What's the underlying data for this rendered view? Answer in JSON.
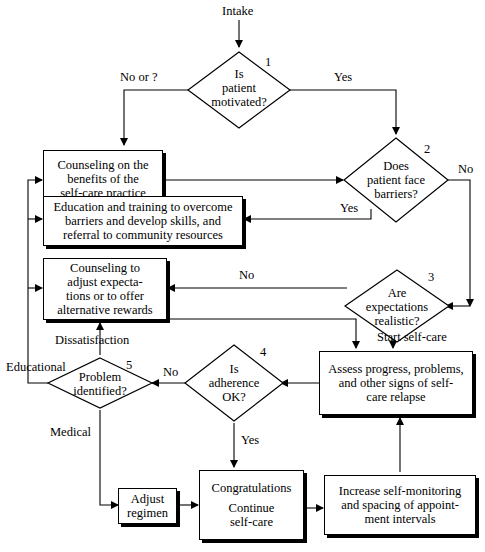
{
  "diagram": {
    "type": "flowchart",
    "start": "Intake",
    "decisions": [
      {
        "id": "d1",
        "number": "1",
        "text": "Is patient motivated?",
        "lines": [
          "Is",
          "patient",
          "motivated?"
        ]
      },
      {
        "id": "d2",
        "number": "2",
        "text": "Does patient face barriers?",
        "lines": [
          "Does",
          "patient face",
          "barriers?"
        ]
      },
      {
        "id": "d3",
        "number": "3",
        "text": "Are expectations realistic?",
        "lines": [
          "Are",
          "expectations",
          "realistic?"
        ]
      },
      {
        "id": "d4",
        "number": "4",
        "text": "Is adherence OK?",
        "lines": [
          "Is",
          "adherence",
          "OK?"
        ]
      },
      {
        "id": "d5",
        "number": "5",
        "text": "Problem identified?",
        "lines": [
          "Problem",
          "identified?"
        ]
      }
    ],
    "processes": [
      {
        "id": "p_counsel_benefits",
        "lines": [
          "Counseling on the",
          "benefits of the",
          "self-care practice"
        ]
      },
      {
        "id": "p_education",
        "lines": [
          "Education and training to overcome",
          "barriers and develop skills, and",
          "referral to community resources"
        ]
      },
      {
        "id": "p_counsel_adjust",
        "lines": [
          "Counseling to",
          "adjust expecta-",
          "tions or to offer",
          "alternative rewards"
        ]
      },
      {
        "id": "p_assess",
        "lines": [
          "Assess progress, problems,",
          "and other signs of self-",
          "care relapse"
        ]
      },
      {
        "id": "p_adjust_regimen",
        "lines": [
          "Adjust",
          "regimen"
        ]
      },
      {
        "id": "p_congrats",
        "lines": [
          "Congratulations",
          "",
          "Continue",
          "self-care"
        ]
      },
      {
        "id": "p_increase",
        "lines": [
          "Increase self-monitoring",
          "and spacing of appoint-",
          "ment intervals"
        ]
      }
    ],
    "edge_labels": {
      "d1_no": "No or ?",
      "d1_yes": "Yes",
      "d2_no": "No",
      "d2_yes": "Yes",
      "d3_no": "No",
      "start_selfcare": "Start self-care",
      "d4_no": "No",
      "d4_yes": "Yes",
      "d5_dissatisfaction": "Dissatisfaction",
      "d5_educational": "Educational",
      "d5_medical": "Medical"
    },
    "edges": [
      {
        "from": "Intake",
        "to": "d1"
      },
      {
        "from": "d1",
        "to": "p_counsel_benefits",
        "label": "No or ?"
      },
      {
        "from": "d1",
        "to": "d2",
        "label": "Yes"
      },
      {
        "from": "p_counsel_benefits",
        "to": "d2"
      },
      {
        "from": "d2",
        "to": "p_education",
        "label": "Yes"
      },
      {
        "from": "d2",
        "to": "d3",
        "label": "No"
      },
      {
        "from": "d3",
        "to": "p_counsel_adjust",
        "label": "No"
      },
      {
        "from": "d3",
        "to": "p_assess",
        "label": "Start self-care"
      },
      {
        "from": "p_counsel_adjust",
        "to": "p_assess"
      },
      {
        "from": "p_assess",
        "to": "d4"
      },
      {
        "from": "d4",
        "to": "d5",
        "label": "No"
      },
      {
        "from": "d4",
        "to": "p_congrats",
        "label": "Yes"
      },
      {
        "from": "d5",
        "to": "p_counsel_adjust",
        "label": "Dissatisfaction"
      },
      {
        "from": "d5",
        "to": "p_counsel_benefits",
        "label": "Educational"
      },
      {
        "from": "d5",
        "to": "p_adjust_regimen",
        "label": "Medical"
      },
      {
        "from": "p_adjust_regimen",
        "to": "p_congrats"
      },
      {
        "from": "p_congrats",
        "to": "p_increase"
      },
      {
        "from": "p_increase",
        "to": "p_assess"
      }
    ]
  }
}
